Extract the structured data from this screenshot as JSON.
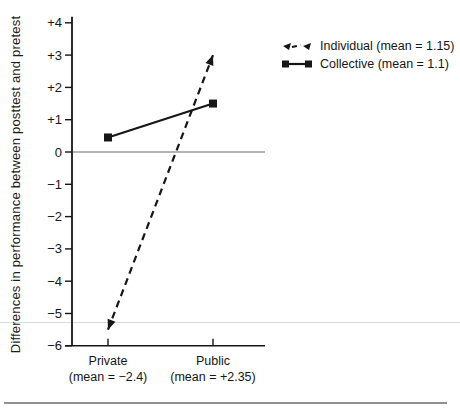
{
  "colors": {
    "series": "#161616",
    "axis": "#161616",
    "zero_line": "#6a6a6a",
    "artifact_line": "#dcdcdc",
    "bottom_rule": "#919191"
  },
  "legend": {
    "items": [
      {
        "label": "Individual (mean = 1.15)",
        "marker": "triangle-dashed"
      },
      {
        "label": "Collective (mean = 1.1)",
        "marker": "square-solid"
      }
    ]
  },
  "chart_data": {
    "type": "line",
    "title": "",
    "categories": [
      "Private",
      "Public"
    ],
    "category_sublabels": [
      "(mean = −2.4)",
      "(mean = +2.35)"
    ],
    "series": [
      {
        "name": "Individual (mean = 1.15)",
        "values": [
          -5.5,
          3.0
        ],
        "line_style": "dashed",
        "marker": "triangle-arrow"
      },
      {
        "name": "Collective (mean = 1.1)",
        "values": [
          0.45,
          1.5
        ],
        "line_style": "solid",
        "marker": "square"
      }
    ],
    "xlabel": "",
    "ylabel": "Differences in performance between posttest and pretest",
    "ylim": [
      -6,
      4
    ],
    "ytick_labels": [
      "+4",
      "+3",
      "+2",
      "+1",
      "0",
      "−1",
      "−2",
      "−3",
      "−4",
      "−5",
      "−6"
    ],
    "zero_line": true,
    "grid": false,
    "legend_position": "top-right"
  }
}
